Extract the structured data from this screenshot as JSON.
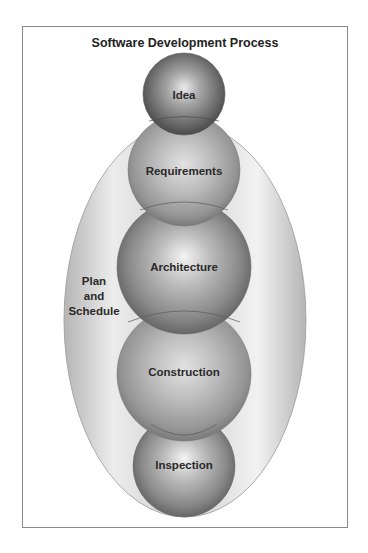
{
  "diagram": {
    "title": "Software Development Process",
    "outer_container": {
      "label_lines": [
        "Plan",
        "and",
        "Schedule"
      ]
    },
    "stages": [
      {
        "label": "Idea"
      },
      {
        "label": "Requirements"
      },
      {
        "label": "Architecture"
      },
      {
        "label": "Construction"
      },
      {
        "label": "Inspection"
      }
    ],
    "colors": {
      "sphere_dark": "#5a5a5a",
      "sphere_light": "#f2f2f2",
      "ellipse_edge": "#b8b8b8",
      "frame_border": "#8a8a8a",
      "text": "#2a2a2a"
    }
  }
}
